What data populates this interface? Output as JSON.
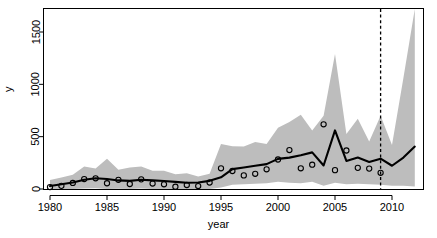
{
  "chart_data": {
    "type": "line",
    "title": "",
    "xlabel": "year",
    "ylabel": "y",
    "xlim": [
      1979.3,
      1912.0
    ],
    "x_range": [
      1979.3,
      2012.6
    ],
    "ylim": [
      -60,
      1800
    ],
    "grid": false,
    "legend": null,
    "x_ticks": [
      1980,
      1985,
      1990,
      1995,
      2000,
      2005,
      2010
    ],
    "x_tick_labels": [
      "1980",
      "1985",
      "1990",
      "1995",
      "2000",
      "2005",
      "2010"
    ],
    "y_ticks": [
      0,
      500,
      1000,
      1500
    ],
    "y_tick_labels": [
      "0",
      "500",
      "1000",
      "1500"
    ],
    "x": [
      1980,
      1981,
      1982,
      1983,
      1984,
      1985,
      1986,
      1987,
      1988,
      1989,
      1990,
      1991,
      1992,
      1993,
      1994,
      1995,
      1996,
      1997,
      1998,
      1999,
      2000,
      2001,
      2002,
      2003,
      2004,
      2005,
      2006,
      2007,
      2008,
      2009,
      2010,
      2011,
      2012
    ],
    "series": [
      {
        "name": "fitted",
        "style": "solid-black-line",
        "color": "#000000",
        "values": [
          28,
          45,
          62,
          88,
          103,
          96,
          82,
          78,
          88,
          82,
          76,
          68,
          60,
          62,
          78,
          112,
          190,
          205,
          222,
          238,
          288,
          300,
          322,
          350,
          225,
          560,
          268,
          300,
          258,
          290,
          222,
          300,
          405
        ]
      },
      {
        "name": "observed",
        "style": "open-circle-points",
        "color": "#000000",
        "values": [
          18,
          30,
          58,
          95,
          102,
          55,
          88,
          48,
          92,
          52,
          45,
          22,
          38,
          28,
          62,
          198,
          172,
          130,
          145,
          188,
          282,
          372,
          198,
          232,
          618,
          180,
          368,
          202,
          195,
          155,
          null,
          null,
          null
        ]
      },
      {
        "name": "upper_interval",
        "style": "grey-band-upper",
        "color": "#bdbdbd",
        "values": [
          85,
          110,
          135,
          215,
          195,
          290,
          185,
          205,
          215,
          175,
          175,
          140,
          150,
          120,
          145,
          430,
          408,
          405,
          450,
          430,
          585,
          640,
          710,
          560,
          700,
          1290,
          525,
          670,
          455,
          700,
          420,
          1060,
          1800
        ]
      },
      {
        "name": "lower_interval",
        "style": "grey-band-lower",
        "color": "#bdbdbd",
        "values": [
          0,
          0,
          0,
          5,
          8,
          0,
          2,
          0,
          5,
          0,
          0,
          0,
          0,
          0,
          0,
          15,
          40,
          45,
          50,
          55,
          70,
          60,
          55,
          70,
          30,
          60,
          45,
          50,
          45,
          40,
          30,
          30,
          25
        ]
      }
    ],
    "annotations": [
      {
        "name": "forecast-start-line",
        "type": "vertical-dashed-line",
        "x": 2009,
        "color": "#000000"
      }
    ],
    "band_color": "#bdbdbd",
    "line_color": "#000000",
    "point_color": "#000000",
    "frame_color": "#000000"
  }
}
